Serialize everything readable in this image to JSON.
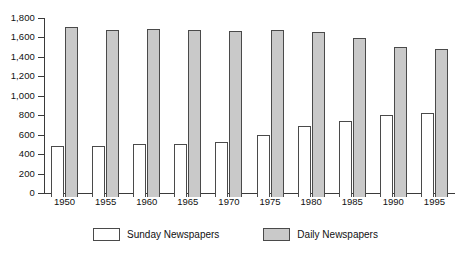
{
  "chart_data": {
    "type": "bar",
    "title": "",
    "subtitle": "",
    "xlabel": "",
    "ylabel": "",
    "categories": [
      "1950",
      "1955",
      "1960",
      "1965",
      "1970",
      "1975",
      "1980",
      "1985",
      "1990",
      "1995"
    ],
    "series": [
      {
        "name": "Sunday Newspapers",
        "color": "#ffffff",
        "values": [
          525,
          520,
          545,
          545,
          565,
          640,
          735,
          780,
          840,
          860
        ]
      },
      {
        "name": "Daily Newspapers",
        "color": "#c9c9c9",
        "values": [
          1745,
          1720,
          1730,
          1715,
          1710,
          1715,
          1700,
          1640,
          1545,
          1520
        ]
      }
    ],
    "ylim": [
      0,
      1800
    ],
    "ytick_step": 200,
    "ytick_labels": [
      "1,800",
      "1,600",
      "1,400",
      "1,200",
      "1,000",
      "800",
      "600",
      "400",
      "200",
      "0"
    ],
    "ytick_values": [
      1800,
      1600,
      1400,
      1200,
      1000,
      800,
      600,
      400,
      200,
      0
    ],
    "grid": false,
    "legend_position": "bottom"
  },
  "legend": {
    "entries": [
      {
        "label": "Sunday Newspapers",
        "swatch": "sunday"
      },
      {
        "label": "Daily Newspapers",
        "swatch": "daily"
      }
    ]
  }
}
